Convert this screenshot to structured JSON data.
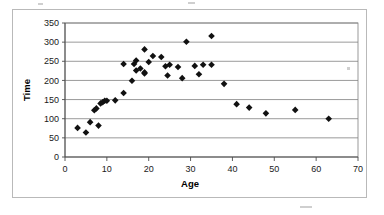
{
  "chart_data": {
    "type": "scatter",
    "title": "",
    "xlabel": "Age",
    "ylabel": "Time",
    "xlim": [
      0,
      70
    ],
    "ylim": [
      0,
      350
    ],
    "xticks": [
      0,
      10,
      20,
      30,
      40,
      50,
      60,
      70
    ],
    "yticks": [
      0,
      50,
      100,
      150,
      200,
      250,
      300,
      350
    ],
    "grid": "horizontal",
    "legend": "none",
    "marker": "diamond",
    "marker_color": "#111111",
    "series": [
      {
        "name": "Time vs Age",
        "points": [
          [
            3,
            76
          ],
          [
            5,
            64
          ],
          [
            6,
            91
          ],
          [
            7,
            122
          ],
          [
            7.5,
            127
          ],
          [
            8,
            82
          ],
          [
            8.5,
            140
          ],
          [
            9,
            143
          ],
          [
            9.5,
            147
          ],
          [
            10,
            147
          ],
          [
            12,
            148
          ],
          [
            14,
            167
          ],
          [
            14,
            243
          ],
          [
            16,
            199
          ],
          [
            16.5,
            243
          ],
          [
            17,
            252
          ],
          [
            17,
            226
          ],
          [
            18,
            231
          ],
          [
            19,
            218
          ],
          [
            19,
            221
          ],
          [
            19,
            281
          ],
          [
            20,
            248
          ],
          [
            21,
            264
          ],
          [
            23,
            261
          ],
          [
            24,
            237
          ],
          [
            24.5,
            213
          ],
          [
            25,
            241
          ],
          [
            27,
            235
          ],
          [
            28,
            206
          ],
          [
            29,
            301
          ],
          [
            31,
            238
          ],
          [
            32,
            216
          ],
          [
            33,
            241
          ],
          [
            35,
            241
          ],
          [
            35,
            316
          ],
          [
            38,
            191
          ],
          [
            41,
            138
          ],
          [
            44,
            129
          ],
          [
            48,
            114
          ],
          [
            55,
            123
          ],
          [
            63,
            100
          ]
        ]
      }
    ]
  },
  "axes": {
    "x_title": "Age",
    "y_title": "Time",
    "x_tick_labels": [
      "0",
      "10",
      "20",
      "30",
      "40",
      "50",
      "60",
      "70"
    ],
    "y_tick_labels": [
      "0",
      "50",
      "100",
      "150",
      "200",
      "250",
      "300",
      "350"
    ]
  }
}
